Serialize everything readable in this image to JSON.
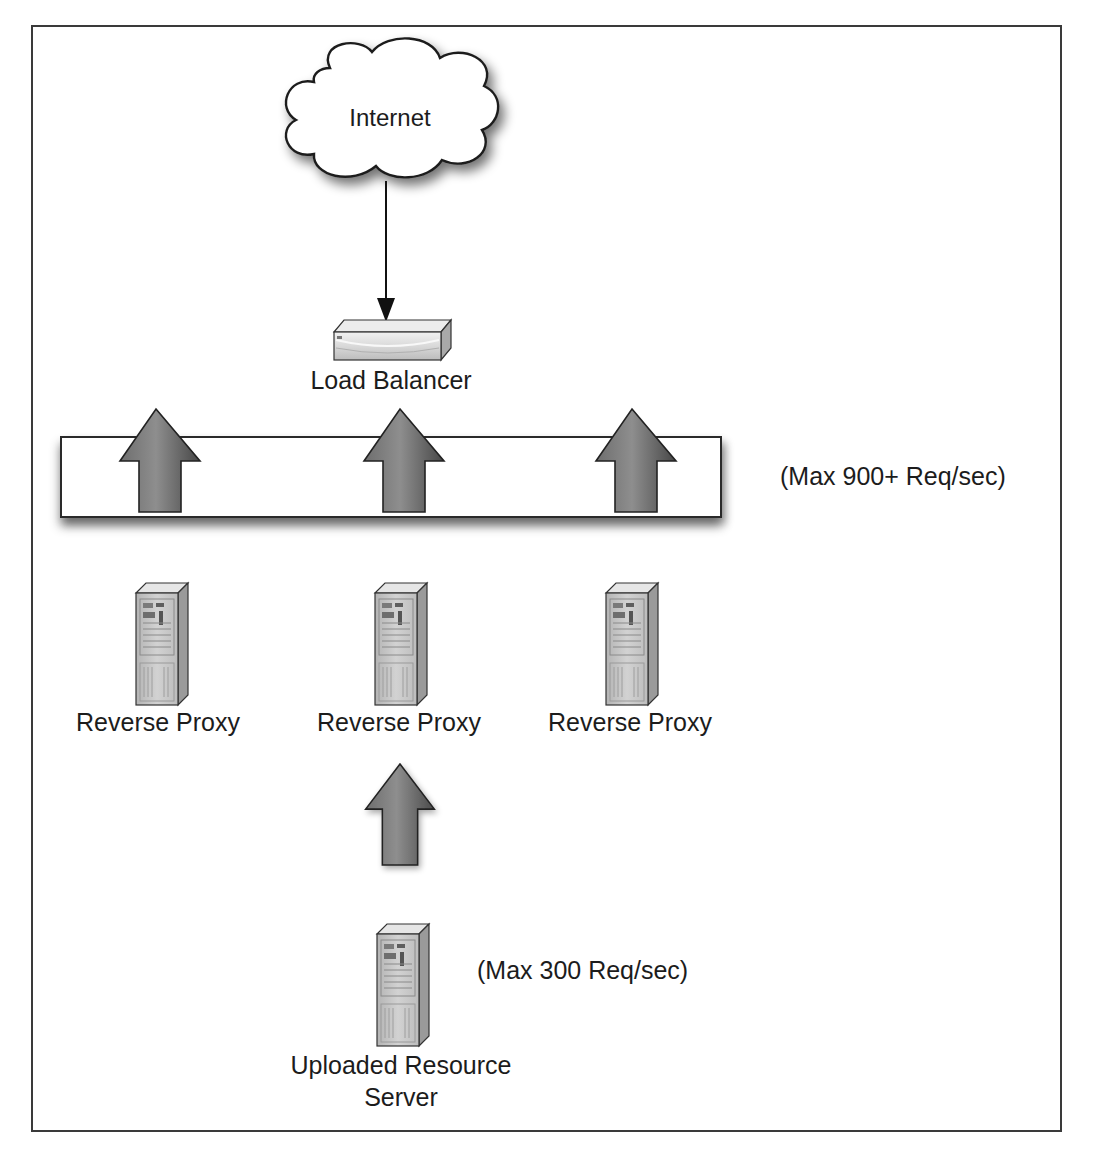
{
  "diagram": {
    "type": "network-architecture",
    "nodes": {
      "internet": {
        "label": "Internet",
        "icon": "cloud-icon"
      },
      "load_balancer": {
        "label": "Load Balancer",
        "icon": "load-balancer-icon"
      },
      "reverse_proxies": [
        {
          "label": "Reverse Proxy",
          "icon": "server-tower-icon"
        },
        {
          "label": "Reverse Proxy",
          "icon": "server-tower-icon"
        },
        {
          "label": "Reverse Proxy",
          "icon": "server-tower-icon"
        }
      ],
      "resource_server": {
        "label_line1": "Uploaded Resource",
        "label_line2": "Server",
        "icon": "server-tower-icon"
      }
    },
    "annotations": {
      "proxy_tier_capacity": "(Max 900+ Req/sec)",
      "resource_server_capacity": "(Max 300 Req/sec)"
    },
    "edges": [
      {
        "from": "Internet",
        "to": "Load Balancer",
        "style": "thin-arrow"
      },
      {
        "from": "Reverse Proxy tier",
        "to": "Load Balancer",
        "style": "block-up-arrow",
        "count": 3
      },
      {
        "from": "Uploaded Resource Server",
        "to": "Reverse Proxy",
        "style": "block-up-arrow"
      }
    ],
    "colors": {
      "border": "#2a2a2a",
      "arrow_fill_light": "#8a8a8a",
      "arrow_fill_dark": "#4a4a4a",
      "server_body": "#c8c8c8"
    }
  }
}
